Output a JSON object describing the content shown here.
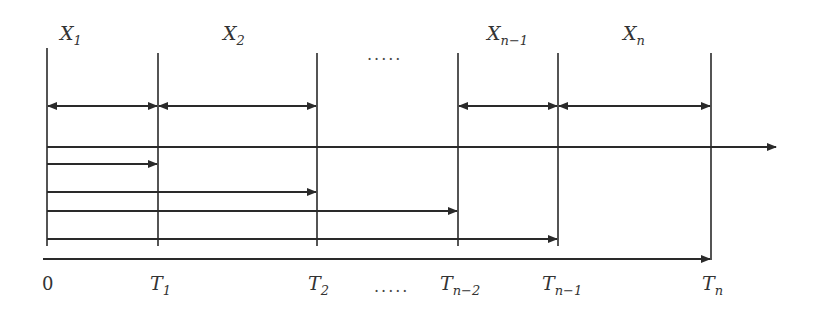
{
  "diagram": {
    "interval_labels": [
      {
        "base": "X",
        "sub": "1",
        "x": 67
      },
      {
        "base": "X",
        "sub": "2",
        "x": 222
      },
      {
        "base": "X",
        "sub": "n−1",
        "x": 490
      },
      {
        "base": "X",
        "sub": "n",
        "x": 623
      }
    ],
    "top_ellipsis": ".....",
    "time_labels": [
      {
        "base": "0",
        "sub": "",
        "x": 42
      },
      {
        "base": "T",
        "sub": "1",
        "x": 150
      },
      {
        "base": "T",
        "sub": "2",
        "x": 308
      },
      {
        "base": "T",
        "sub": "n−2",
        "x": 440
      },
      {
        "base": "T",
        "sub": "n−1",
        "x": 542
      },
      {
        "base": "T",
        "sub": "n",
        "x": 702
      }
    ],
    "bottom_ellipsis": ".....",
    "epoch_positions_px": [
      47,
      158,
      317,
      458,
      558,
      711
    ],
    "colors": {
      "line": "#2a2a2a",
      "text": "#333333"
    }
  }
}
